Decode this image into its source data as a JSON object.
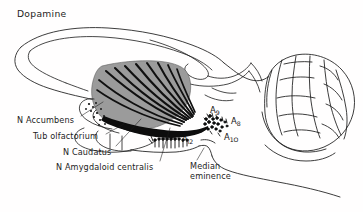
{
  "figure": {
    "title": "Dopamine",
    "domain": "neuroanatomy-sagittal-brain-diagram",
    "background_color": "#ffffff",
    "line_color": "#1a1a1a",
    "striatum_fill": "#9a9a9a",
    "fiber_color": "#0d0d0d"
  },
  "labels": {
    "accumbens": "N Accumbens",
    "tub_olfactorium": "Tub olfactorium",
    "caudatus": "N Caudatus",
    "amygdaloid": "N Amygdaloid centralis",
    "median_line1": "Median",
    "median_line2": "eminence"
  },
  "cell_groups": {
    "a9": {
      "letter": "A",
      "number": "9"
    },
    "a8": {
      "letter": "A",
      "number": "8"
    },
    "a10": {
      "letter": "A",
      "number": "1O"
    },
    "a12": {
      "letter": "A",
      "number": "l2"
    }
  }
}
